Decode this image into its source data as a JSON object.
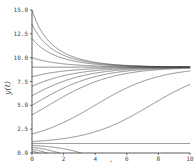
{
  "chart_data": {
    "type": "line",
    "title": "",
    "xlabel": "t",
    "ylabel": "y(t)",
    "xlim": [
      0,
      10
    ],
    "ylim": [
      0,
      15
    ],
    "xticks": [
      0,
      2,
      4,
      6,
      8,
      10
    ],
    "xtick_labels": [
      "0",
      "2",
      "4",
      "6",
      "8",
      "10"
    ],
    "yticks": [
      0,
      2.5,
      5,
      7.5,
      10,
      12.5,
      15
    ],
    "ytick_labels": [
      "0.0",
      "2.5",
      "5.0",
      "7.5",
      "10.0",
      "12.5",
      "15.0"
    ],
    "grid": false,
    "legend": "none",
    "line_color": "#555555",
    "model": "dy/dt = r (y - a)(1 - y/K) with threshold a and carrying capacity K",
    "equilibria": {
      "lower": 1.0,
      "upper": 9.0
    },
    "series": [
      {
        "name": "y0=15",
        "y0": 15.0
      },
      {
        "name": "y0=13.5",
        "y0": 13.5
      },
      {
        "name": "y0=12",
        "y0": 12.0
      },
      {
        "name": "y0=10",
        "y0": 10.0
      },
      {
        "name": "y0=9",
        "y0": 9.0
      },
      {
        "name": "y0=8",
        "y0": 8.0
      },
      {
        "name": "y0=7",
        "y0": 7.0
      },
      {
        "name": "y0=6",
        "y0": 6.0
      },
      {
        "name": "y0=5",
        "y0": 5.0
      },
      {
        "name": "y0=4",
        "y0": 4.0
      },
      {
        "name": "y0=2",
        "y0": 2.0
      },
      {
        "name": "y0=1.2",
        "y0": 1.2
      },
      {
        "name": "y0=1",
        "y0": 1.0
      },
      {
        "name": "y0=0.8",
        "y0": 0.8
      },
      {
        "name": "y0=0.6",
        "y0": 0.6
      },
      {
        "name": "y0=0.4",
        "y0": 0.4
      },
      {
        "name": "y0=0.2",
        "y0": 0.2
      }
    ]
  },
  "params": {
    "r": 0.55,
    "a": 1.0,
    "K": 9.0
  }
}
